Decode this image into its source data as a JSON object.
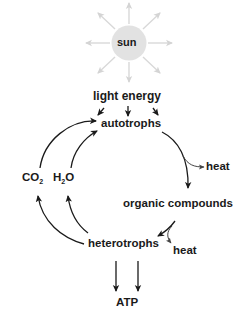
{
  "diagram": {
    "type": "energy-cycle",
    "nodes": {
      "sun": "sun",
      "light_energy": "light energy",
      "autotrophs": "autotrophs",
      "heat_1": "heat",
      "organic_compounds": "organic compounds",
      "heterotrophs": "heterotrophs",
      "heat_2": "heat",
      "co2_main": "CO",
      "co2_sub": "2",
      "h2o_h": "H",
      "h2o_sub": "2",
      "h2o_o": "O",
      "atp": "ATP"
    },
    "edges": [
      {
        "from": "sun",
        "to": "light energy"
      },
      {
        "from": "light energy",
        "to": "autotrophs"
      },
      {
        "from": "autotrophs",
        "to": "organic compounds"
      },
      {
        "from": "autotrophs",
        "to": "heat"
      },
      {
        "from": "organic compounds",
        "to": "heterotrophs"
      },
      {
        "from": "organic compounds",
        "to": "heat"
      },
      {
        "from": "heterotrophs",
        "to": "CO2"
      },
      {
        "from": "heterotrophs",
        "to": "H2O"
      },
      {
        "from": "CO2",
        "to": "autotrophs"
      },
      {
        "from": "H2O",
        "to": "autotrophs"
      },
      {
        "from": "heterotrophs",
        "to": "ATP"
      }
    ],
    "colors": {
      "sun_fill": "#e2e2e2",
      "sun_rays": "#d4d4d4",
      "arrows": "#1a1a1a",
      "text": "#1a1a1a"
    }
  }
}
